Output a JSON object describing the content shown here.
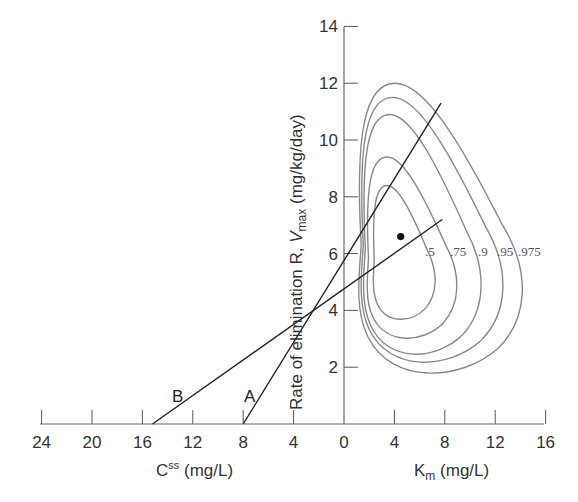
{
  "chart_data": {
    "type": "line",
    "title": "",
    "x_axis": {
      "left_label": "C^ss (mg/L)",
      "left_label_main": "C",
      "left_label_sup": "ss",
      "left_label_unit": " (mg/L)",
      "right_label": "Km (mg/L)",
      "right_label_main": "K",
      "right_label_sub": "m",
      "right_label_unit": " (mg/L)",
      "range": [
        -24,
        16
      ],
      "ticks": [
        -24,
        -20,
        -16,
        -12,
        -8,
        -4,
        0,
        4,
        8,
        12,
        16
      ],
      "tick_labels": [
        "24",
        "20",
        "16",
        "12",
        "8",
        "4",
        "0",
        "4",
        "8",
        "12",
        "16"
      ]
    },
    "y_axis": {
      "label": "Rate of elimination R, Vmax (mg/kg/day)",
      "label_prefix": "Rate of elimination R, ",
      "label_v": "V",
      "label_sub": "max",
      "label_unit": " (mg/kg/day)",
      "range": [
        0,
        14
      ],
      "ticks": [
        2,
        4,
        6,
        8,
        10,
        12,
        14
      ],
      "tick_labels": [
        "2",
        "4",
        "6",
        "8",
        "10",
        "12",
        "14"
      ]
    },
    "series": [
      {
        "name": "A",
        "type": "line",
        "x": [
          -8,
          7.7
        ],
        "y": [
          0,
          11.3
        ],
        "css": 8,
        "r_intercept": 3.9
      },
      {
        "name": "B",
        "type": "line",
        "x": [
          -15.2,
          7.8
        ],
        "y": [
          0,
          7.2
        ],
        "css": 15.2,
        "r_intercept": 4.7
      }
    ],
    "point_estimate": {
      "label": "Km, Vmax estimate",
      "x": 4.5,
      "y": 6.6
    },
    "contours": [
      {
        "level": ".5",
        "xmin": 2.3,
        "xmax": 7.4,
        "ymin": 3.6,
        "ymax": 8.4
      },
      {
        "level": ".75",
        "xmin": 1.8,
        "xmax": 9.2,
        "ymin": 2.9,
        "ymax": 9.4
      },
      {
        "level": ".9",
        "xmin": 1.5,
        "xmax": 11.2,
        "ymin": 2.3,
        "ymax": 10.9
      },
      {
        "level": ".95",
        "xmin": 1.3,
        "xmax": 13.0,
        "ymin": 2.0,
        "ymax": 11.5
      },
      {
        "level": ".975",
        "xmin": 1.1,
        "xmax": 14.6,
        "ymin": 1.6,
        "ymax": 12.0
      }
    ],
    "contour_labels": [
      ".5",
      ".75",
      ".9",
      ".95",
      ".975"
    ],
    "line_labels": [
      "A",
      "B"
    ],
    "grid": false,
    "legend": "none"
  },
  "colors": {
    "axis": "#555555",
    "contour": "#888888",
    "line": "#222222",
    "text": "#333333"
  }
}
